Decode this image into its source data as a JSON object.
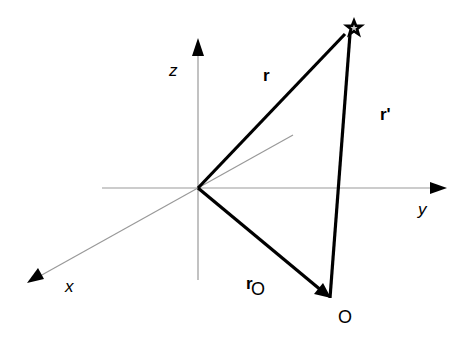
{
  "diagram": {
    "axes": {
      "x_label": "x",
      "y_label": "y",
      "z_label": "z",
      "color": "#999999"
    },
    "vectors": {
      "r": {
        "label": "r",
        "from": "origin",
        "to": "star"
      },
      "r_prime": {
        "label": "r'",
        "from": "O",
        "to": "star"
      },
      "r_o": {
        "label": "r",
        "subscript": "O",
        "from": "origin",
        "to": "O"
      },
      "color": "#000000"
    },
    "points": {
      "O": {
        "label": "O"
      },
      "star": {
        "symbol": "star",
        "color": "#000000"
      }
    }
  }
}
